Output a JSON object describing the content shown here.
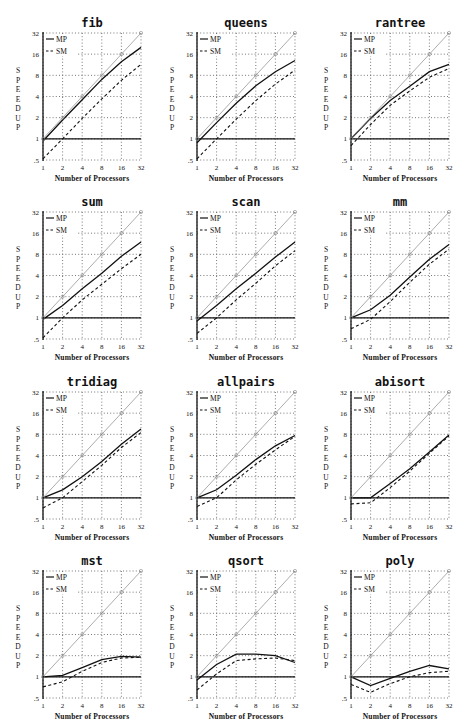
{
  "figure": {
    "ylabel": "SPEEDUP",
    "xlabel": "Number of Processors",
    "legend": {
      "mp": "MP",
      "sm": "SM"
    },
    "colors": {
      "ink": "#111111",
      "grid": "#555555",
      "ideal": "#888888",
      "background": "#ffffff"
    }
  },
  "chart_data": [
    {
      "type": "line",
      "title": "fib",
      "xlabel": "Number of Processors",
      "ylabel": "SPEEDUP",
      "x": [
        1,
        2,
        4,
        8,
        16,
        32
      ],
      "xticks": [
        "1",
        "2",
        "4",
        "8",
        "16",
        "32"
      ],
      "yticks": [
        ".5",
        "1",
        "2",
        "4",
        "8",
        "16",
        "32"
      ],
      "ylim": [
        0.5,
        32
      ],
      "yscale": "log2",
      "xscale": "log2",
      "grid": true,
      "legend_position": "upper-left",
      "series": [
        {
          "name": "MP",
          "style": "solid",
          "values": [
            0.93,
            1.85,
            3.6,
            7.0,
            12.5,
            20
          ]
        },
        {
          "name": "SM",
          "style": "dashed",
          "values": [
            0.52,
            1.0,
            1.95,
            3.7,
            6.8,
            11.5
          ]
        },
        {
          "name": "ideal",
          "style": "dotted",
          "values": [
            1,
            2,
            4,
            8,
            16,
            32
          ]
        },
        {
          "name": "baseline",
          "style": "solid",
          "values": [
            1,
            1,
            1,
            1,
            1,
            1
          ]
        }
      ]
    },
    {
      "type": "line",
      "title": "queens",
      "xlabel": "Number of Processors",
      "ylabel": "SPEEDUP",
      "x": [
        1,
        2,
        4,
        8,
        16,
        32
      ],
      "xticks": [
        "1",
        "2",
        "4",
        "8",
        "16",
        "32"
      ],
      "yticks": [
        ".5",
        "1",
        "2",
        "4",
        "8",
        "16",
        "32"
      ],
      "ylim": [
        0.5,
        32
      ],
      "yscale": "log2",
      "xscale": "log2",
      "grid": true,
      "legend_position": "upper-left",
      "series": [
        {
          "name": "MP",
          "style": "solid",
          "values": [
            0.88,
            1.7,
            3.2,
            5.7,
            9.0,
            13
          ]
        },
        {
          "name": "SM",
          "style": "dashed",
          "values": [
            0.52,
            1.0,
            1.9,
            3.5,
            6.0,
            9.5
          ]
        },
        {
          "name": "ideal",
          "style": "dotted",
          "values": [
            1,
            2,
            4,
            8,
            16,
            32
          ]
        },
        {
          "name": "baseline",
          "style": "solid",
          "values": [
            1,
            1,
            1,
            1,
            1,
            1
          ]
        }
      ]
    },
    {
      "type": "line",
      "title": "rantree",
      "xlabel": "Number of Processors",
      "ylabel": "SPEEDUP",
      "x": [
        1,
        2,
        4,
        8,
        16,
        32
      ],
      "xticks": [
        "1",
        "2",
        "4",
        "8",
        "16",
        "32"
      ],
      "yticks": [
        ".5",
        "1",
        "2",
        "4",
        "8",
        "16",
        "32"
      ],
      "ylim": [
        0.5,
        32
      ],
      "yscale": "log2",
      "xscale": "log2",
      "grid": true,
      "legend_position": "upper-left",
      "series": [
        {
          "name": "MP",
          "style": "solid",
          "values": [
            1.0,
            1.95,
            3.5,
            5.6,
            9.0,
            11.5
          ]
        },
        {
          "name": "SM",
          "style": "dashed",
          "values": [
            0.8,
            1.6,
            3.0,
            4.8,
            7.5,
            10
          ]
        },
        {
          "name": "ideal",
          "style": "dotted",
          "values": [
            1,
            2,
            4,
            8,
            16,
            32
          ]
        },
        {
          "name": "baseline",
          "style": "solid",
          "values": [
            1,
            1,
            1,
            1,
            1,
            1
          ]
        }
      ]
    },
    {
      "type": "line",
      "title": "sum",
      "xlabel": "Number of Processors",
      "ylabel": "SPEEDUP",
      "x": [
        1,
        2,
        4,
        8,
        16,
        32
      ],
      "xticks": [
        "1",
        "2",
        "4",
        "8",
        "16",
        "32"
      ],
      "yticks": [
        ".5",
        "1",
        "2",
        "4",
        "8",
        "16",
        "32"
      ],
      "ylim": [
        0.5,
        32
      ],
      "yscale": "log2",
      "xscale": "log2",
      "grid": true,
      "legend_position": "upper-left",
      "series": [
        {
          "name": "MP",
          "style": "solid",
          "values": [
            0.95,
            1.5,
            2.6,
            4.3,
            7.5,
            12
          ]
        },
        {
          "name": "SM",
          "style": "dashed",
          "values": [
            0.52,
            1.0,
            1.8,
            3.0,
            5.0,
            8
          ]
        },
        {
          "name": "ideal",
          "style": "dotted",
          "values": [
            1,
            2,
            4,
            8,
            16,
            32
          ]
        },
        {
          "name": "baseline",
          "style": "solid",
          "values": [
            1,
            1,
            1,
            1,
            1,
            1
          ]
        }
      ]
    },
    {
      "type": "line",
      "title": "scan",
      "xlabel": "Number of Processors",
      "ylabel": "SPEEDUP",
      "x": [
        1,
        2,
        4,
        8,
        16,
        32
      ],
      "xticks": [
        "1",
        "2",
        "4",
        "8",
        "16",
        "32"
      ],
      "yticks": [
        ".5",
        "1",
        "2",
        "4",
        "8",
        "16",
        "32"
      ],
      "ylim": [
        0.5,
        32
      ],
      "yscale": "log2",
      "xscale": "log2",
      "grid": true,
      "legend_position": "upper-left",
      "series": [
        {
          "name": "MP",
          "style": "solid",
          "values": [
            0.9,
            1.5,
            2.6,
            4.3,
            7.3,
            12
          ]
        },
        {
          "name": "SM",
          "style": "dashed",
          "values": [
            0.6,
            1.0,
            1.8,
            3.1,
            5.5,
            9
          ]
        },
        {
          "name": "ideal",
          "style": "dotted",
          "values": [
            1,
            2,
            4,
            8,
            16,
            32
          ]
        },
        {
          "name": "baseline",
          "style": "solid",
          "values": [
            1,
            1,
            1,
            1,
            1,
            1
          ]
        }
      ]
    },
    {
      "type": "line",
      "title": "mm",
      "xlabel": "Number of Processors",
      "ylabel": "SPEEDUP",
      "x": [
        1,
        2,
        4,
        8,
        16,
        32
      ],
      "xticks": [
        "1",
        "2",
        "4",
        "8",
        "16",
        "32"
      ],
      "yticks": [
        ".5",
        "1",
        "2",
        "4",
        "8",
        "16",
        "32"
      ],
      "ylim": [
        0.5,
        32
      ],
      "yscale": "log2",
      "xscale": "log2",
      "grid": true,
      "legend_position": "upper-left",
      "series": [
        {
          "name": "MP",
          "style": "solid",
          "values": [
            1.0,
            1.3,
            2.1,
            3.8,
            6.8,
            11
          ]
        },
        {
          "name": "SM",
          "style": "dashed",
          "values": [
            0.7,
            0.95,
            1.7,
            3.2,
            5.8,
            9.5
          ]
        },
        {
          "name": "ideal",
          "style": "dotted",
          "values": [
            1,
            2,
            4,
            8,
            16,
            32
          ]
        },
        {
          "name": "baseline",
          "style": "solid",
          "values": [
            1,
            1,
            1,
            1,
            1,
            1
          ]
        }
      ]
    },
    {
      "type": "line",
      "title": "tridiag",
      "xlabel": "Number of Processors",
      "ylabel": "SPEEDUP",
      "x": [
        1,
        2,
        4,
        8,
        16,
        32
      ],
      "xticks": [
        "1",
        "2",
        "4",
        "8",
        "16",
        "32"
      ],
      "yticks": [
        ".5",
        "1",
        "2",
        "4",
        "8",
        "16",
        "32"
      ],
      "ylim": [
        0.5,
        32
      ],
      "yscale": "log2",
      "xscale": "log2",
      "grid": true,
      "legend_position": "upper-left",
      "series": [
        {
          "name": "MP",
          "style": "solid",
          "values": [
            1.0,
            1.3,
            2.0,
            3.3,
            5.8,
            9.5
          ]
        },
        {
          "name": "SM",
          "style": "dashed",
          "values": [
            0.72,
            1.0,
            1.7,
            2.9,
            5.2,
            8.5
          ]
        },
        {
          "name": "ideal",
          "style": "dotted",
          "values": [
            1,
            2,
            4,
            8,
            16,
            32
          ]
        },
        {
          "name": "baseline",
          "style": "solid",
          "values": [
            1,
            1,
            1,
            1,
            1,
            1
          ]
        }
      ]
    },
    {
      "type": "line",
      "title": "allpairs",
      "xlabel": "Number of Processors",
      "ylabel": "SPEEDUP",
      "x": [
        1,
        2,
        4,
        8,
        16,
        32
      ],
      "xticks": [
        "1",
        "2",
        "4",
        "8",
        "16",
        "32"
      ],
      "yticks": [
        ".5",
        "1",
        "2",
        "4",
        "8",
        "16",
        "32"
      ],
      "ylim": [
        0.5,
        32
      ],
      "yscale": "log2",
      "xscale": "log2",
      "grid": true,
      "legend_position": "upper-left",
      "series": [
        {
          "name": "MP",
          "style": "solid",
          "values": [
            1.0,
            1.3,
            2.1,
            3.5,
            5.5,
            7.7
          ]
        },
        {
          "name": "SM",
          "style": "dashed",
          "values": [
            0.75,
            1.0,
            1.8,
            3.0,
            4.8,
            7.5
          ]
        },
        {
          "name": "ideal",
          "style": "dotted",
          "values": [
            1,
            2,
            4,
            8,
            16,
            32
          ]
        },
        {
          "name": "baseline",
          "style": "solid",
          "values": [
            1,
            1,
            1,
            1,
            1,
            1
          ]
        }
      ]
    },
    {
      "type": "line",
      "title": "abisort",
      "xlabel": "Number of Processors",
      "ylabel": "SPEEDUP",
      "x": [
        1,
        2,
        4,
        8,
        16,
        32
      ],
      "xticks": [
        "1",
        "2",
        "4",
        "8",
        "16",
        "32"
      ],
      "yticks": [
        ".5",
        "1",
        "2",
        "4",
        "8",
        "16",
        "32"
      ],
      "ylim": [
        0.5,
        32
      ],
      "yscale": "log2",
      "xscale": "log2",
      "grid": true,
      "legend_position": "upper-left",
      "series": [
        {
          "name": "MP",
          "style": "solid",
          "values": [
            1.0,
            1.0,
            1.6,
            2.6,
            4.5,
            7.8
          ]
        },
        {
          "name": "SM",
          "style": "dashed",
          "values": [
            0.82,
            0.85,
            1.4,
            2.4,
            4.3,
            7.6
          ]
        },
        {
          "name": "ideal",
          "style": "dotted",
          "values": [
            1,
            2,
            4,
            8,
            16,
            32
          ]
        },
        {
          "name": "baseline",
          "style": "solid",
          "values": [
            1,
            1,
            1,
            1,
            1,
            1
          ]
        }
      ]
    },
    {
      "type": "line",
      "title": "mst",
      "xlabel": "Number of Processors",
      "ylabel": "SPEEDUP",
      "x": [
        1,
        2,
        4,
        8,
        16,
        32
      ],
      "xticks": [
        "1",
        "2",
        "4",
        "8",
        "16",
        "32"
      ],
      "yticks": [
        ".5",
        "1",
        "2",
        "4",
        "8",
        "16",
        "32"
      ],
      "ylim": [
        0.5,
        32
      ],
      "yscale": "log2",
      "xscale": "log2",
      "grid": true,
      "legend_position": "upper-left",
      "series": [
        {
          "name": "MP",
          "style": "solid",
          "values": [
            1.0,
            1.05,
            1.35,
            1.75,
            1.95,
            1.9
          ]
        },
        {
          "name": "SM",
          "style": "dashed",
          "values": [
            0.72,
            0.85,
            1.2,
            1.6,
            1.85,
            1.9
          ]
        },
        {
          "name": "ideal",
          "style": "dotted",
          "values": [
            1,
            2,
            4,
            8,
            16,
            32
          ]
        },
        {
          "name": "baseline",
          "style": "solid",
          "values": [
            1,
            1,
            1,
            1,
            1,
            1
          ]
        }
      ]
    },
    {
      "type": "line",
      "title": "qsort",
      "xlabel": "Number of Processors",
      "ylabel": "SPEEDUP",
      "x": [
        1,
        2,
        4,
        8,
        16,
        32
      ],
      "xticks": [
        "1",
        "2",
        "4",
        "8",
        "16",
        "32"
      ],
      "yticks": [
        ".5",
        "1",
        "2",
        "4",
        "8",
        "16",
        "32"
      ],
      "ylim": [
        0.5,
        32
      ],
      "yscale": "log2",
      "xscale": "log2",
      "grid": true,
      "legend_position": "upper-left",
      "series": [
        {
          "name": "MP",
          "style": "solid",
          "values": [
            0.9,
            1.5,
            2.1,
            2.1,
            2.0,
            1.6
          ]
        },
        {
          "name": "SM",
          "style": "dashed",
          "values": [
            0.65,
            1.1,
            1.7,
            1.8,
            1.85,
            1.7
          ]
        },
        {
          "name": "ideal",
          "style": "dotted",
          "values": [
            1,
            2,
            4,
            8,
            16,
            32
          ]
        },
        {
          "name": "baseline",
          "style": "solid",
          "values": [
            1,
            1,
            1,
            1,
            1,
            1
          ]
        }
      ]
    },
    {
      "type": "line",
      "title": "poly",
      "xlabel": "Number of Processors",
      "ylabel": "SPEEDUP",
      "x": [
        1,
        2,
        4,
        8,
        16,
        32
      ],
      "xticks": [
        "1",
        "2",
        "4",
        "8",
        "16",
        "32"
      ],
      "yticks": [
        ".5",
        "1",
        "2",
        "4",
        "8",
        "16",
        "32"
      ],
      "ylim": [
        0.5,
        32
      ],
      "yscale": "log2",
      "xscale": "log2",
      "grid": true,
      "legend_position": "upper-left",
      "series": [
        {
          "name": "MP",
          "style": "solid",
          "values": [
            1.0,
            0.75,
            0.95,
            1.2,
            1.45,
            1.3
          ]
        },
        {
          "name": "SM",
          "style": "dashed",
          "values": [
            0.78,
            0.6,
            0.8,
            1.0,
            1.15,
            1.2
          ]
        },
        {
          "name": "ideal",
          "style": "dotted",
          "values": [
            1,
            2,
            4,
            8,
            16,
            32
          ]
        },
        {
          "name": "baseline",
          "style": "solid",
          "values": [
            1,
            1,
            1,
            1,
            1,
            1
          ]
        }
      ]
    }
  ],
  "layout": {
    "columns_x": [
      43,
      197,
      351
    ],
    "rows_y": [
      33,
      212,
      392,
      571
    ],
    "plot_width": 98,
    "plot_height": 127
  }
}
